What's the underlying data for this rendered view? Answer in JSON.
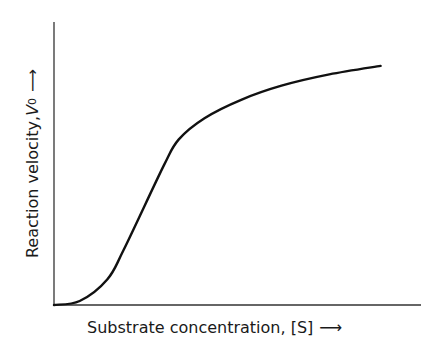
{
  "chart_data": {
    "type": "line",
    "title": "",
    "xlabel": "Substrate concentration, [S]",
    "ylabel": "Reaction velocity, V0",
    "x_axis": {
      "label_text": "Substrate concentration, [S]",
      "arrow": "⟶",
      "ticks": []
    },
    "y_axis": {
      "label_prefix": "Reaction velocity, ",
      "label_var": "V",
      "label_sub": "0",
      "arrow": "⟶",
      "ticks": []
    },
    "grid": false,
    "legend": null,
    "xlim": [
      0,
      1
    ],
    "ylim": [
      0,
      1
    ],
    "series": [
      {
        "name": "sigmoidal kinetics curve",
        "color": "#111111",
        "x": [
          0.0,
          0.07,
          0.145,
          0.19,
          0.3,
          0.34,
          0.41,
          0.51,
          0.62,
          0.75,
          0.89
        ],
        "y": [
          0.0,
          0.014,
          0.09,
          0.195,
          0.495,
          0.585,
          0.66,
          0.725,
          0.775,
          0.815,
          0.845
        ]
      }
    ],
    "annotations": []
  },
  "labels": {
    "x_text": "Substrate concentration, [S]",
    "x_arrow": "⟶",
    "y_prefix": "Reaction velocity, ",
    "y_var": "V",
    "y_sub": "0",
    "y_arrow": "⟶"
  },
  "colors": {
    "axis": "#333333",
    "curve": "#111111",
    "background": "#ffffff"
  }
}
